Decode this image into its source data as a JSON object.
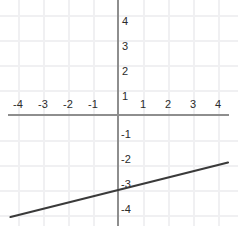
{
  "chart_data": {
    "type": "line",
    "title": "",
    "xlabel": "",
    "ylabel": "",
    "xlim": [
      -4.7,
      4.5
    ],
    "ylim": [
      -4.6,
      4.6
    ],
    "grid": true,
    "legend": false,
    "x_ticks": [
      -4,
      -3,
      -2,
      -1,
      1,
      2,
      3,
      4
    ],
    "y_ticks": [
      4,
      3,
      2,
      1,
      -1,
      -2,
      -3,
      -4
    ],
    "x_tick_labels": [
      "-4",
      "-3",
      "-2",
      "-1",
      "1",
      "2",
      "3",
      "4"
    ],
    "y_tick_labels": [
      "4",
      "3",
      "2",
      "1",
      "-1",
      "-2",
      "-3",
      "-4"
    ],
    "series": [
      {
        "name": "line",
        "slope": 0.25,
        "intercept": -3,
        "color": "#3a3a3a",
        "x": [
          -4.3,
          4.4
        ],
        "y": [
          -4.08,
          -1.9
        ]
      }
    ],
    "annotations": {
      "edge_glyph": ")"
    }
  },
  "axes": {
    "axis_color": "#8e8e8e",
    "grid_color": "#f0f0f2",
    "background": "#ffffff"
  }
}
